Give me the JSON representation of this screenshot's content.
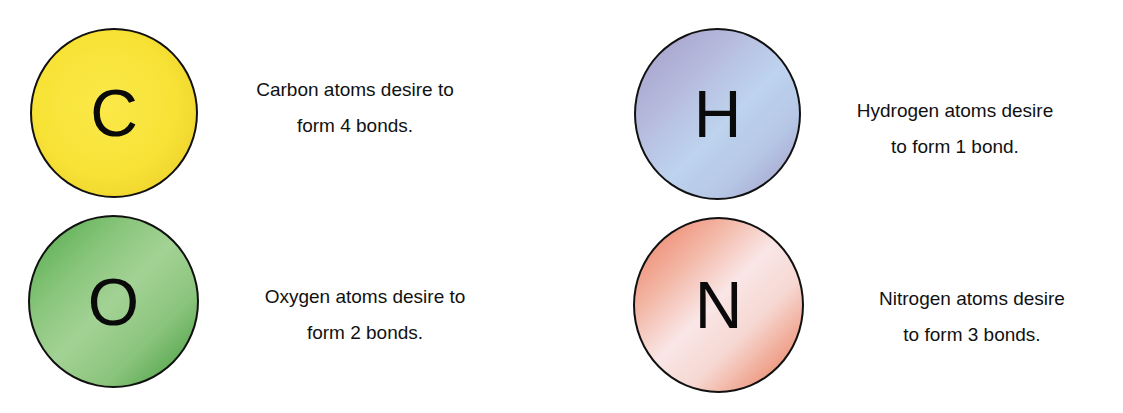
{
  "atoms": [
    {
      "element": "Carbon",
      "symbol": "C",
      "bonds": 4,
      "color": "#f7e235",
      "caption_line1": "Carbon atoms desire to",
      "caption_line2": "form 4 bonds."
    },
    {
      "element": "Oxygen",
      "symbol": "O",
      "bonds": 2,
      "color": "#7fbf6f",
      "caption_line1": "Oxygen atoms desire to",
      "caption_line2": "form 2 bonds."
    },
    {
      "element": "Hydrogen",
      "symbol": "H",
      "bonds": 1,
      "color": "#b6c3e4",
      "caption_line1": "Hydrogen atoms desire",
      "caption_line2": "to form 1 bond."
    },
    {
      "element": "Nitrogen",
      "symbol": "N",
      "bonds": 3,
      "color": "#f2b3a2",
      "caption_line1": "Nitrogen atoms desire",
      "caption_line2": "to form 3 bonds."
    }
  ]
}
